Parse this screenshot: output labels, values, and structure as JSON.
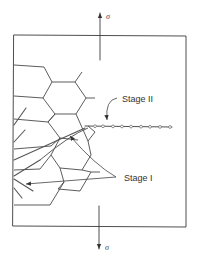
{
  "figure": {
    "stress_symbol_top": "σ",
    "stress_symbol_bottom": "σ",
    "labels": {
      "stage_two": "Stage II",
      "stage_one": "Stage I"
    },
    "elements": {
      "specimen": "rectangular-specimen",
      "grains": "hexagonal-grain-boundaries",
      "stage_one_crack": "crystallographic slip-band crack",
      "stage_two_crack": "striated crack perpendicular to stress",
      "striation_count": 9
    },
    "colors": {
      "line": "#3a3a3a",
      "background": "#ffffff"
    }
  }
}
